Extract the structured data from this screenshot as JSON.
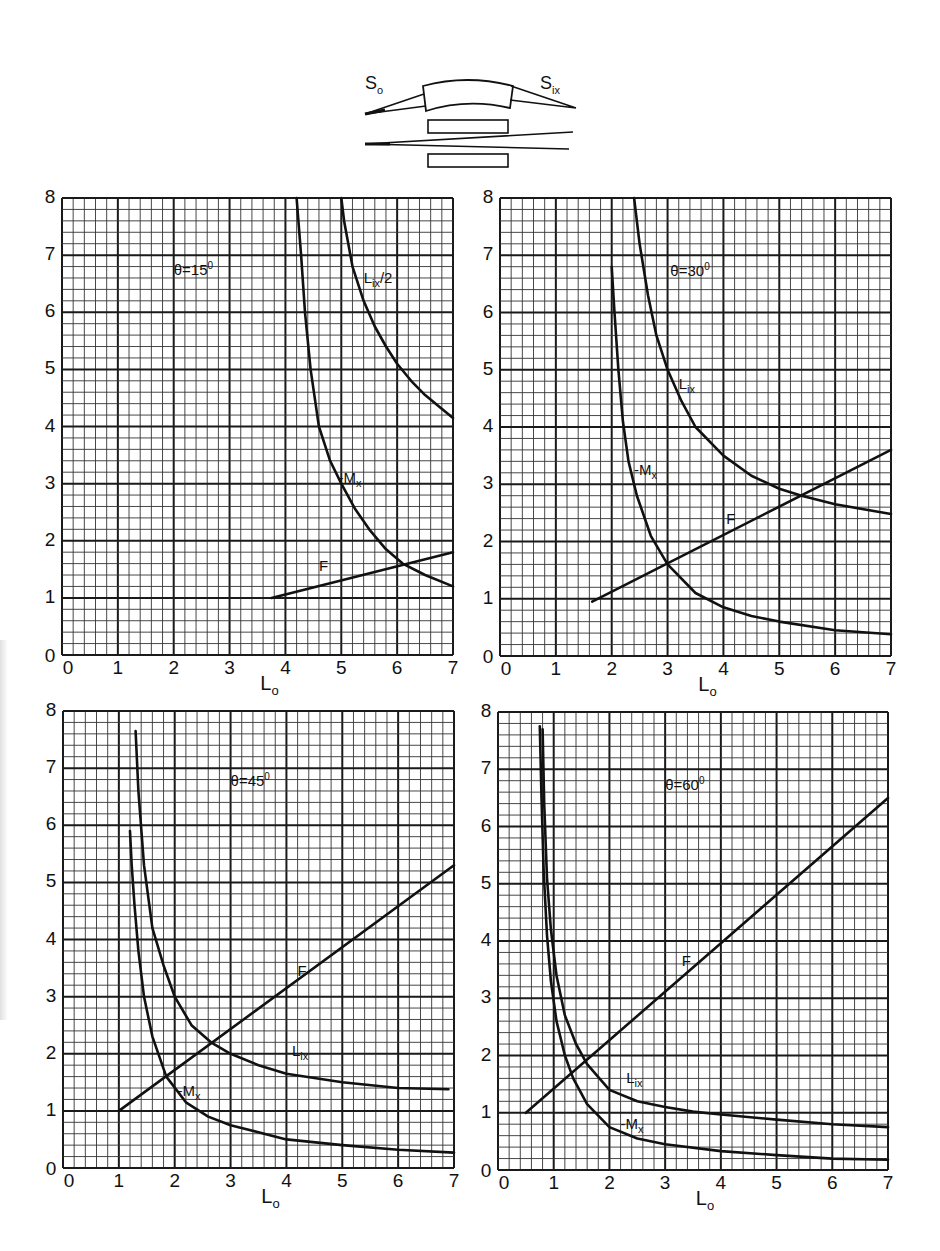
{
  "figure": {
    "schematic": {
      "label_source": "S",
      "label_source_sub": "o",
      "label_image": "S",
      "label_image_sub": "ix"
    },
    "ink_color": "#111111",
    "grid_major_color": "#1a1a1a",
    "grid_minor_color": "#333333",
    "background_color": "#ffffff"
  },
  "chart_data": [
    {
      "type": "line",
      "title": "θ=15°",
      "theta_label": "θ=15",
      "theta_unit": "0",
      "xlabel": "L",
      "xlabel_sub": "o",
      "ylabel": "",
      "xlim": [
        0,
        7
      ],
      "ylim": [
        0,
        8
      ],
      "xticks": [
        "0",
        "1",
        "2",
        "3",
        "4",
        "5",
        "6",
        "7"
      ],
      "yticks": [
        "0",
        "1",
        "2",
        "3",
        "4",
        "5",
        "6",
        "7",
        "8"
      ],
      "grid": true,
      "minor_divisions": 5,
      "series": [
        {
          "name": "-M",
          "name_sub": "x",
          "label_pos": [
            4.95,
            3.1
          ],
          "x": [
            4.2,
            4.28,
            4.35,
            4.45,
            4.6,
            4.8,
            5.0,
            5.25,
            5.5,
            5.8,
            6.1,
            6.5,
            7.0
          ],
          "y": [
            8.0,
            7.0,
            6.0,
            5.0,
            4.0,
            3.4,
            3.0,
            2.55,
            2.2,
            1.85,
            1.6,
            1.4,
            1.2
          ]
        },
        {
          "name": "L",
          "name_sub": "ix",
          "name_suffix": "/2",
          "label_pos": [
            5.4,
            6.6
          ],
          "x": [
            5.0,
            5.05,
            5.2,
            5.4,
            5.6,
            5.8,
            6.0,
            6.25,
            6.5,
            6.75,
            7.0
          ],
          "y": [
            8.0,
            7.6,
            6.8,
            6.2,
            5.75,
            5.4,
            5.1,
            4.8,
            4.55,
            4.35,
            4.15
          ]
        },
        {
          "name": "F",
          "name_sub": "",
          "label_pos": [
            4.6,
            1.55
          ],
          "x": [
            3.75,
            7.0
          ],
          "y": [
            1.0,
            1.8
          ]
        }
      ]
    },
    {
      "type": "line",
      "title": "θ=30°",
      "theta_label": "θ=30",
      "theta_unit": "0",
      "xlabel": "L",
      "xlabel_sub": "o",
      "ylabel": "",
      "xlim": [
        0,
        7
      ],
      "ylim": [
        0,
        8
      ],
      "xticks": [
        "0",
        "1",
        "2",
        "3",
        "4",
        "5",
        "6",
        "7"
      ],
      "yticks": [
        "0",
        "1",
        "2",
        "3",
        "4",
        "5",
        "6",
        "7",
        "8"
      ],
      "grid": true,
      "minor_divisions": 5,
      "series": [
        {
          "name": "-M",
          "name_sub": "x",
          "label_pos": [
            2.4,
            3.25
          ],
          "x": [
            2.0,
            2.05,
            2.12,
            2.2,
            2.3,
            2.45,
            2.7,
            3.0,
            3.5,
            4.0,
            4.5,
            5.0,
            6.0,
            7.0
          ],
          "y": [
            6.8,
            6.0,
            5.0,
            4.1,
            3.4,
            2.8,
            2.1,
            1.6,
            1.1,
            0.85,
            0.7,
            0.6,
            0.45,
            0.38
          ]
        },
        {
          "name": "L",
          "name_sub": "ix",
          "name_suffix": "",
          "label_pos": [
            3.2,
            4.75
          ],
          "x": [
            2.4,
            2.5,
            2.65,
            2.8,
            3.0,
            3.25,
            3.5,
            4.0,
            4.5,
            5.0,
            5.4,
            6.0,
            7.0
          ],
          "y": [
            8.0,
            7.2,
            6.3,
            5.6,
            5.0,
            4.45,
            4.0,
            3.5,
            3.15,
            2.92,
            2.8,
            2.65,
            2.48
          ]
        },
        {
          "name": "F",
          "name_sub": "",
          "label_pos": [
            4.05,
            2.4
          ],
          "x": [
            1.65,
            7.0
          ],
          "y": [
            0.95,
            3.6
          ]
        }
      ]
    },
    {
      "type": "line",
      "title": "θ=45°",
      "theta_label": "θ=45",
      "theta_unit": "0",
      "xlabel": "L",
      "xlabel_sub": "o",
      "ylabel": "",
      "xlim": [
        0,
        7
      ],
      "ylim": [
        0,
        8
      ],
      "xticks": [
        "0",
        "1",
        "2",
        "3",
        "4",
        "5",
        "6",
        "7"
      ],
      "yticks": [
        "0",
        "1",
        "2",
        "3",
        "4",
        "5",
        "6",
        "7",
        "8"
      ],
      "grid": true,
      "minor_divisions": 5,
      "series": [
        {
          "name": "-M",
          "name_sub": "x",
          "label_pos": [
            2.05,
            1.35
          ],
          "x": [
            1.2,
            1.23,
            1.28,
            1.35,
            1.45,
            1.6,
            1.85,
            2.2,
            2.6,
            3.0,
            4.0,
            5.0,
            6.0,
            7.0
          ],
          "y": [
            5.9,
            5.3,
            4.6,
            3.8,
            3.0,
            2.3,
            1.6,
            1.15,
            0.9,
            0.75,
            0.5,
            0.4,
            0.32,
            0.27
          ]
        },
        {
          "name": "L",
          "name_sub": "ix",
          "name_suffix": "",
          "label_pos": [
            4.1,
            2.05
          ],
          "x": [
            1.3,
            1.35,
            1.45,
            1.6,
            1.8,
            2.0,
            2.3,
            2.65,
            3.0,
            3.5,
            4.0,
            5.0,
            6.0,
            6.9
          ],
          "y": [
            7.65,
            6.6,
            5.3,
            4.2,
            3.55,
            3.0,
            2.5,
            2.2,
            2.0,
            1.8,
            1.65,
            1.5,
            1.4,
            1.38
          ]
        },
        {
          "name": "F",
          "name_sub": "",
          "label_pos": [
            4.2,
            3.45
          ],
          "x": [
            1.0,
            7.0
          ],
          "y": [
            1.0,
            5.3
          ]
        }
      ]
    },
    {
      "type": "line",
      "title": "θ=60°",
      "theta_label": "θ=60",
      "theta_unit": "0",
      "xlabel": "L",
      "xlabel_sub": "o",
      "ylabel": "",
      "xlim": [
        0,
        7
      ],
      "ylim": [
        0,
        8
      ],
      "xticks": [
        "0",
        "1",
        "2",
        "3",
        "4",
        "5",
        "6",
        "7"
      ],
      "yticks": [
        "0",
        "1",
        "2",
        "3",
        "4",
        "5",
        "6",
        "7",
        "8"
      ],
      "grid": true,
      "minor_divisions": 5,
      "series": [
        {
          "name": "-M",
          "name_sub": "x",
          "label_pos": [
            2.2,
            0.8
          ],
          "x": [
            0.75,
            0.78,
            0.82,
            0.88,
            0.95,
            1.05,
            1.2,
            1.35,
            1.6,
            2.0,
            2.5,
            3.0,
            4.0,
            5.0,
            6.0,
            7.0
          ],
          "y": [
            7.75,
            6.5,
            5.2,
            4.1,
            3.3,
            2.6,
            2.0,
            1.6,
            1.15,
            0.75,
            0.55,
            0.45,
            0.33,
            0.26,
            0.2,
            0.18
          ]
        },
        {
          "name": "L",
          "name_sub": "ix",
          "name_suffix": "",
          "label_pos": [
            2.3,
            1.6
          ],
          "x": [
            0.8,
            0.83,
            0.88,
            0.95,
            1.05,
            1.2,
            1.4,
            1.6,
            2.0,
            2.5,
            3.0,
            3.5,
            4.0,
            5.0,
            6.0,
            7.0
          ],
          "y": [
            7.7,
            6.4,
            5.1,
            4.2,
            3.4,
            2.7,
            2.2,
            1.85,
            1.4,
            1.2,
            1.1,
            1.02,
            0.97,
            0.88,
            0.8,
            0.75
          ]
        },
        {
          "name": "F",
          "name_sub": "",
          "label_pos": [
            3.3,
            3.65
          ],
          "x": [
            0.5,
            7.0
          ],
          "y": [
            1.0,
            6.5
          ]
        }
      ]
    }
  ]
}
